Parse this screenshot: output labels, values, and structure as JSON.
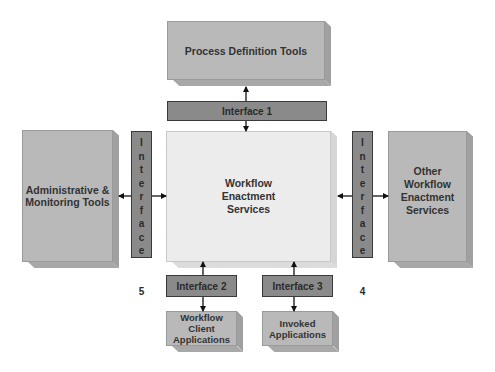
{
  "nodes": {
    "process_definition": {
      "label": "Process Definition Tools"
    },
    "admin_monitoring": {
      "label_lines": [
        "Administrative &",
        "Monitoring Tools"
      ]
    },
    "enactment": {
      "label_lines": [
        "Workflow",
        "Enactment",
        "Services"
      ]
    },
    "other_enactment": {
      "label_lines": [
        "Other Workflow",
        "Enactment",
        "Services"
      ]
    },
    "client_apps": {
      "label_lines": [
        "Workflow",
        "Client",
        "Applications"
      ]
    },
    "invoked_apps": {
      "label_lines": [
        "Invoked",
        "Applications"
      ]
    }
  },
  "interfaces": {
    "i1": {
      "label": "Interface 1"
    },
    "i2": {
      "label": "Interface 2"
    },
    "i3": {
      "label": "Interface 3"
    },
    "i4": {
      "letters": [
        "I",
        "n",
        "t",
        "e",
        "r",
        "f",
        "a",
        "c",
        "e",
        "",
        "",
        "4"
      ]
    },
    "i5": {
      "letters": [
        "I",
        "n",
        "t",
        "e",
        "r",
        "f",
        "a",
        "c",
        "e",
        "",
        "",
        "5"
      ]
    }
  },
  "colors": {
    "main_box": "#ececec",
    "side_box": "#b9b9b9",
    "interface_bar": "#8a8a8a",
    "text": "#333333"
  }
}
